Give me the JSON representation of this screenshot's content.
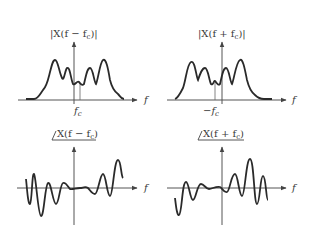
{
  "panels": [
    {
      "id": "mag-shift-pos",
      "title": "|X(f − f_c)|",
      "title_display": "|X(f − f",
      "title_sub": "c",
      "title_close": ")|",
      "x_axis_label": "f",
      "marker_label": "f",
      "marker_sub": "c",
      "type": "magnitude"
    },
    {
      "id": "mag-shift-neg",
      "title": "|X(f + f_c)|",
      "title_display": "|X(f + f",
      "title_sub": "c",
      "title_close": ")|",
      "x_axis_label": "f",
      "marker_label": "−f",
      "marker_sub": "c",
      "type": "magnitude"
    },
    {
      "id": "phase-shift-pos",
      "title": "∠X(f − f_c)",
      "title_display": "X(f − f",
      "title_sub": "c",
      "title_close": ")",
      "x_axis_label": "f",
      "type": "phase"
    },
    {
      "id": "phase-shift-neg",
      "title": "∠X(f + f_c)",
      "title_display": "X(f + f",
      "title_sub": "c",
      "title_close": ")",
      "x_axis_label": "f",
      "type": "phase"
    }
  ],
  "colors": {
    "curve": "#2a2a2a",
    "axis": "#555555",
    "text": "#3a3a3a"
  }
}
